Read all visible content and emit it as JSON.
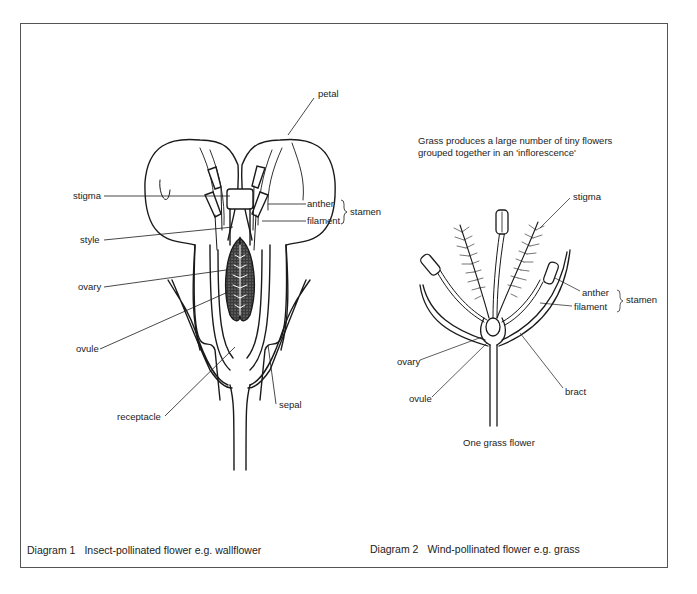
{
  "diagram1": {
    "caption_number": "Diagram 1",
    "caption_text": "Insect-pollinated flower e.g. wallflower",
    "labels": {
      "petal": "petal",
      "stigma": "stigma",
      "style": "style",
      "ovary": "ovary",
      "ovule": "ovule",
      "receptacle": "receptacle",
      "sepal": "sepal",
      "anther": "anther",
      "filament": "filament",
      "stamen": "stamen"
    }
  },
  "diagram2": {
    "caption_number": "Diagram 2",
    "caption_text": "Wind-pollinated flower e.g. grass",
    "note_line1": "Grass produces a large number of tiny flowers",
    "note_line2": "grouped together in an 'inflorescence'",
    "subcaption": "One grass flower",
    "labels": {
      "stigma": "stigma",
      "anther": "anther",
      "filament": "filament",
      "stamen": "stamen",
      "ovary": "ovary",
      "ovule": "ovule",
      "bract": "bract"
    }
  },
  "colors": {
    "ink": "#1a1a1a",
    "frame": "#555555",
    "background": "#ffffff"
  }
}
